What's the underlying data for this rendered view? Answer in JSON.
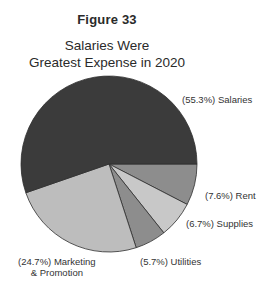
{
  "figure": {
    "label": "Figure 33",
    "title_line1": "Salaries Were",
    "title_line2": "Greatest Expense in 2020"
  },
  "labels": {
    "salaries": "(55.3%) Salaries",
    "rent": "(7.6%) Rent",
    "supplies": "(6.7%) Supplies",
    "utilities": "(5.7%) Utilities",
    "marketing_line1": "(24.7%) Marketing",
    "marketing_line2": "& Promotion"
  },
  "chart_data": {
    "type": "pie",
    "title": "Salaries Were Greatest Expense in 2020",
    "subtitle": "Figure 33",
    "start_angle_deg": 0,
    "direction": "clockwise",
    "categories": [
      "Rent",
      "Supplies",
      "Utilities",
      "Marketing & Promotion",
      "Salaries"
    ],
    "values": [
      7.6,
      6.7,
      5.7,
      24.7,
      55.3
    ],
    "unit": "%",
    "colors": [
      "#8d8d8d",
      "#c8c8c8",
      "#8d8d8d",
      "#bdbdbd",
      "#3b3b3b"
    ],
    "center": [
      109,
      164
    ],
    "radius": 88,
    "legend": "none (direct slice labels)"
  }
}
